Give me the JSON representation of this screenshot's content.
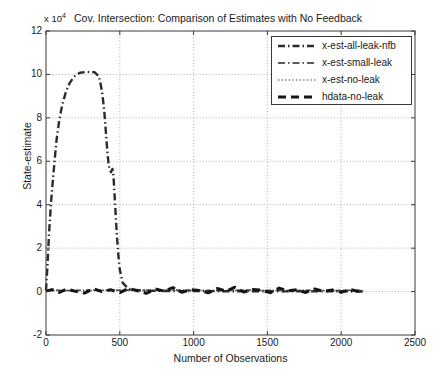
{
  "chart_data": {
    "type": "line",
    "title": "Cov. Intersection: Comparison of Estimates with No Feedback",
    "xlabel": "Number of Observations",
    "ylabel": "State-estimate",
    "y_exponent_label": "x 10",
    "y_exponent_power": "4",
    "y_scale_factor": 10000,
    "xlim": [
      0,
      2500
    ],
    "ylim": [
      -2,
      12
    ],
    "xticks": [
      0,
      500,
      1000,
      1500,
      2000,
      2500
    ],
    "yticks": [
      -2,
      0,
      2,
      4,
      6,
      8,
      10,
      12
    ],
    "grid": true,
    "grid_style": "dotted",
    "legend_position": "top-right",
    "series": [
      {
        "name": "x-est-all-leak-nfb",
        "style": "dashdot",
        "color": "#2b2b2b",
        "width": 2.4,
        "x": [
          0,
          10,
          20,
          35,
          50,
          70,
          90,
          110,
          135,
          160,
          190,
          230,
          280,
          330,
          360,
          380,
          395,
          405,
          415,
          425,
          440,
          450,
          455,
          460,
          465,
          470,
          475,
          480,
          490,
          500,
          520,
          560,
          640,
          760,
          900,
          1100,
          1400,
          1700,
          2000,
          2150
        ],
        "y": [
          0.05,
          1.2,
          2.6,
          4.2,
          5.4,
          6.9,
          7.9,
          8.6,
          9.2,
          9.6,
          9.9,
          10.08,
          10.12,
          10.1,
          9.9,
          9.2,
          8.3,
          7.4,
          6.5,
          5.8,
          5.5,
          5.65,
          5.5,
          5.0,
          4.4,
          3.8,
          3.2,
          2.6,
          1.7,
          1.0,
          0.4,
          0.12,
          0.05,
          0.03,
          0.02,
          0.02,
          0.01,
          0.01,
          0.01,
          0.0
        ]
      },
      {
        "name": "x-est-small-leak",
        "style": "dashdot",
        "color": "#4a4a4a",
        "width": 1.6,
        "x": [
          0,
          60,
          160,
          300,
          460,
          600,
          760,
          900,
          1060,
          1200,
          1360,
          1500,
          1660,
          1800,
          1960,
          2080,
          2150
        ],
        "y": [
          0.04,
          0.06,
          0.05,
          0.07,
          0.06,
          0.08,
          0.05,
          0.07,
          0.06,
          0.05,
          0.07,
          0.06,
          0.05,
          0.06,
          0.05,
          0.06,
          0.05
        ]
      },
      {
        "name": "x-est-no-leak",
        "style": "dotted",
        "color": "#6a6a6a",
        "width": 1.3,
        "x": [
          0,
          80,
          200,
          340,
          480,
          640,
          800,
          960,
          1120,
          1280,
          1440,
          1600,
          1760,
          1920,
          2060,
          2150
        ],
        "y": [
          0.03,
          0.05,
          0.04,
          0.06,
          0.05,
          0.04,
          0.06,
          0.05,
          0.04,
          0.05,
          0.06,
          0.04,
          0.05,
          0.04,
          0.05,
          0.04
        ]
      },
      {
        "name": "hdata-no-leak",
        "style": "dashed",
        "color": "#151515",
        "width": 3.0,
        "x": [
          0,
          40,
          90,
          140,
          200,
          260,
          320,
          380,
          440,
          500,
          560,
          620,
          680,
          740,
          800,
          860,
          920,
          980,
          1040,
          1100,
          1160,
          1220,
          1280,
          1340,
          1400,
          1460,
          1520,
          1580,
          1640,
          1700,
          1760,
          1820,
          1880,
          1940,
          2000,
          2060,
          2110,
          2150
        ],
        "y": [
          0.02,
          0.09,
          -0.04,
          0.11,
          0.01,
          -0.07,
          0.13,
          0.0,
          0.08,
          -0.05,
          0.15,
          0.03,
          -0.08,
          0.12,
          0.02,
          0.18,
          -0.03,
          0.09,
          0.05,
          -0.06,
          0.14,
          0.02,
          0.2,
          -0.02,
          0.1,
          0.06,
          -0.05,
          0.16,
          0.03,
          0.08,
          -0.04,
          0.12,
          0.01,
          0.07,
          -0.03,
          0.1,
          0.02,
          0.05
        ]
      }
    ],
    "annotations": {
      "plateau_value": 10.1,
      "plateau_x_range": [
        230,
        355
      ],
      "data_end_x": 2150
    }
  },
  "legend": {
    "entries": [
      {
        "label": "x-est-all-leak-nfb"
      },
      {
        "label": "x-est-small-leak"
      },
      {
        "label": "x-est-no-leak"
      },
      {
        "label": "hdata-no-leak"
      }
    ]
  },
  "axes": {
    "y_tick_labels": [
      "12",
      "10",
      "8",
      "6",
      "4",
      "2",
      "0",
      "-2"
    ],
    "x_tick_labels": [
      "0",
      "500",
      "1000",
      "1500",
      "2000",
      "2500"
    ]
  }
}
